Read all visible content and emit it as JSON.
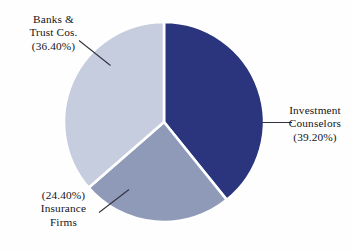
{
  "chart_data": {
    "type": "pie",
    "title": "",
    "subtitle": "",
    "xlabel": "",
    "ylabel": "",
    "legend_position": "none",
    "grid": false,
    "start_angle_deg": 0,
    "direction": "clockwise",
    "categories": [
      "Investment Counselors",
      "Insurance Firms",
      "Banks & Trust Cos."
    ],
    "values": [
      39.2,
      24.4,
      36.4
    ],
    "value_labels": [
      "(39.20%)",
      "(24.40%)",
      "(36.40%)"
    ],
    "colors": [
      "#2a357e",
      "#8e9ab8",
      "#c5cdde"
    ],
    "slices": [
      {
        "name": "Investment Counselors",
        "value": 39.2,
        "value_label": "(39.20%)",
        "color": "#2a357e",
        "start_deg": 0,
        "end_deg": 141.12,
        "label_position": "right"
      },
      {
        "name": "Insurance Firms",
        "value": 24.4,
        "value_label": "(24.40%)",
        "color": "#8e9ab8",
        "start_deg": 141.12,
        "end_deg": 228.96,
        "label_position": "bottom-left"
      },
      {
        "name": "Banks & Trust Cos.",
        "value": 36.4,
        "value_label": "(36.40%)",
        "color": "#c5cdde",
        "start_deg": 228.96,
        "end_deg": 360,
        "label_position": "top-left"
      }
    ]
  },
  "labels": {
    "banks": {
      "line1": "Banks &",
      "line2": "Trust Cos.",
      "line3": "(36.40%)"
    },
    "investment": {
      "line1": "Investment",
      "line2": "Counselors",
      "line3": "(39.20%)"
    },
    "insurance": {
      "line1": "(24.40%)",
      "line2": "Insurance",
      "line3": "Firms"
    }
  },
  "style": {
    "background": "#fdfdfd",
    "leader_line_color": "#32323c",
    "slice_gap_color": "#ffffff",
    "navy": "#2a357e",
    "mid_blue_grey": "#8e9ab8",
    "light_blue_grey": "#c5cdde"
  }
}
